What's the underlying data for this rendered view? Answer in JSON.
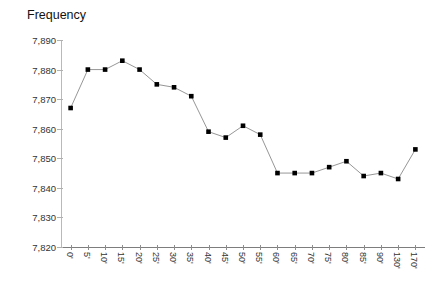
{
  "chart_data": {
    "type": "line",
    "title": "Frequency",
    "xlabel": "",
    "ylabel": "",
    "ylim": [
      7820,
      7890
    ],
    "ytick_step": 10,
    "ytick_labels": [
      "7,890",
      "7,880",
      "7,870",
      "7,860",
      "7,850",
      "7,840",
      "7,830",
      "7,820"
    ],
    "ytick_values": [
      7890,
      7880,
      7870,
      7860,
      7850,
      7840,
      7830,
      7820
    ],
    "grid": false,
    "legend": "none",
    "marker": "filled-square",
    "marker_color": "#000000",
    "line_color": "#8a8a8a",
    "categories": [
      "0'",
      "5'",
      "10'",
      "15'",
      "20'",
      "25'",
      "30'",
      "35'",
      "40'",
      "45'",
      "50'",
      "55'",
      "60'",
      "65'",
      "70'",
      "75'",
      "80'",
      "85'",
      "90'",
      "130'",
      "170'"
    ],
    "values": [
      7867,
      7880,
      7880,
      7883,
      7880,
      7875,
      7874,
      7871,
      7859,
      7857,
      7861,
      7858,
      7845,
      7845,
      7845,
      7847,
      7849,
      7844,
      7845,
      7843,
      7853
    ]
  }
}
